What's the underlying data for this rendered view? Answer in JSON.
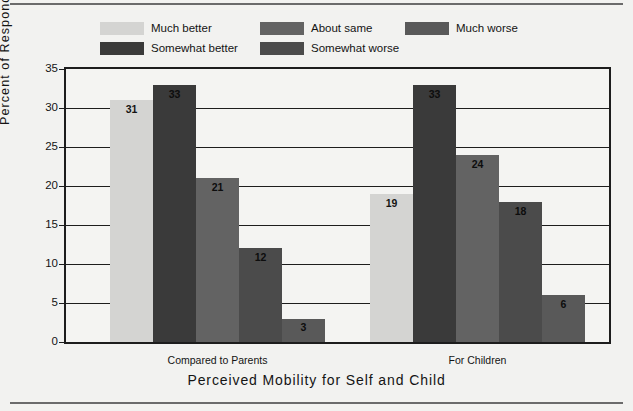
{
  "chart_data": {
    "type": "bar",
    "title": "",
    "xlabel": "Perceived Mobility for Self and Child",
    "ylabel": "Percent of Respondents",
    "categories": [
      "Compared to Parents",
      "For Children"
    ],
    "ylim": [
      0,
      35
    ],
    "yticks": [
      0,
      5,
      10,
      15,
      20,
      25,
      30,
      35
    ],
    "grid": true,
    "legend_position": "top",
    "series": [
      {
        "name": "Much better",
        "color": "#d4d4d2",
        "values": [
          31,
          19
        ]
      },
      {
        "name": "Somewhat better",
        "color": "#3a3a3a",
        "values": [
          33,
          33
        ]
      },
      {
        "name": "About same",
        "color": "#636363",
        "values": [
          21,
          24
        ]
      },
      {
        "name": "Somewhat worse",
        "color": "#4b4b4b",
        "values": [
          12,
          18
        ]
      },
      {
        "name": "Much worse",
        "color": "#595959",
        "values": [
          3,
          6
        ]
      }
    ]
  },
  "yticklabels": [
    "0",
    "5",
    "10",
    "15",
    "20",
    "25",
    "30",
    "35"
  ],
  "legend": {
    "items": [
      {
        "label": "Much better",
        "color": "#d4d4d2"
      },
      {
        "label": "Somewhat better",
        "color": "#3a3a3a"
      },
      {
        "label": "About same",
        "color": "#636363"
      },
      {
        "label": "Somewhat worse",
        "color": "#4b4b4b"
      },
      {
        "label": "Much worse",
        "color": "#595959"
      }
    ]
  },
  "axes": {
    "y_title": "Percent of Respondents",
    "x_title": "Perceived Mobility for Self and Child",
    "group_labels": [
      "Compared to Parents",
      "For Children"
    ]
  },
  "bar_labels": {
    "g0": [
      "31",
      "33",
      "21",
      "12",
      "3"
    ],
    "g1": [
      "19",
      "33",
      "24",
      "18",
      "6"
    ]
  }
}
